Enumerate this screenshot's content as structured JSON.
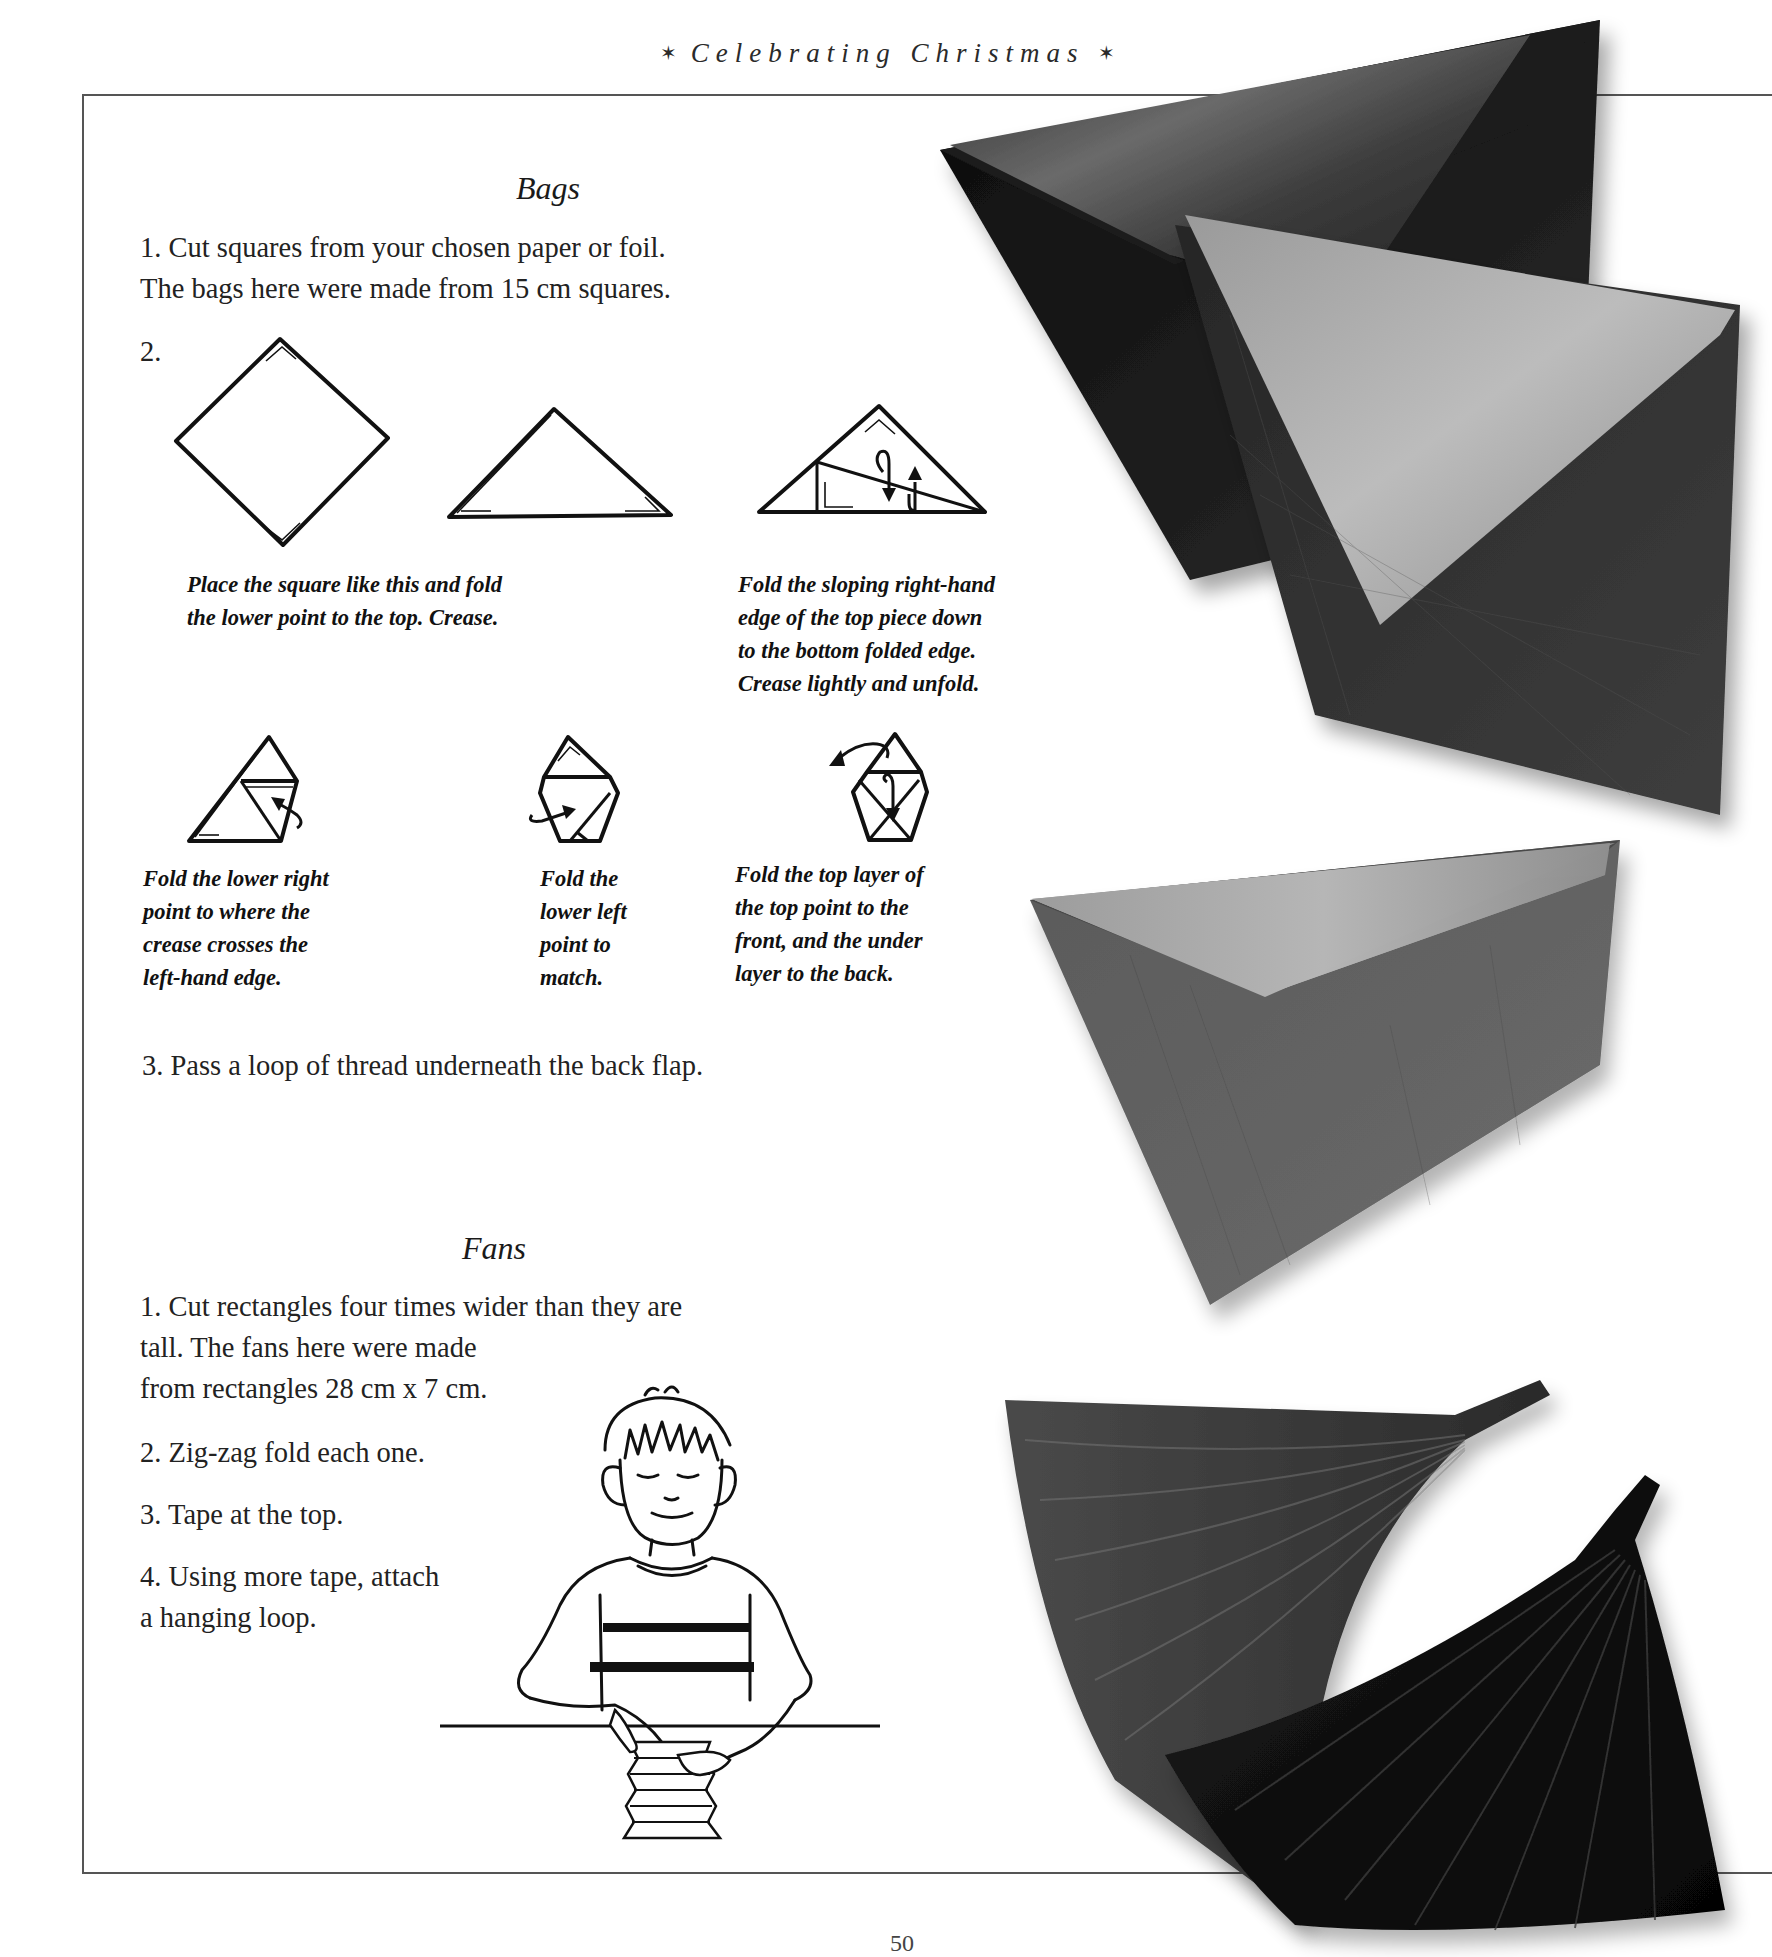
{
  "header": {
    "running_head": "Celebrating Christmas",
    "ornament_left": "✶",
    "ornament_right": "✶"
  },
  "bags": {
    "title": "Bags",
    "step1_line1": "1. Cut squares from your chosen paper or foil.",
    "step1_line2": "The bags here were made from 15 cm squares.",
    "step2_label": "2.",
    "captions": {
      "fold_to_top": [
        "Place the square like this and fold",
        "the lower point to the top. Crease."
      ],
      "sloping_edge": [
        "Fold the sloping right-hand",
        "edge of the top piece down",
        "to the bottom folded edge.",
        "Crease lightly and unfold."
      ],
      "lower_right": [
        "Fold the lower right",
        "point to where the",
        "crease crosses the",
        "left-hand edge."
      ],
      "lower_left": [
        "Fold the",
        "lower left",
        "point to",
        "match."
      ],
      "top_layer": [
        "Fold the top layer of",
        "the top point to the",
        "front, and the under",
        "layer to the back."
      ]
    },
    "step3": "3. Pass a loop of thread underneath the back flap."
  },
  "fans": {
    "title": "Fans",
    "step1_line1": "1. Cut rectangles four times wider than they are",
    "step1_line2": "tall. The fans here were made",
    "step1_line3": "from rectangles 28 cm x 7 cm.",
    "step2": "2. Zig-zag fold each one.",
    "step3": "3. Tape at the top.",
    "step4_line1": "4. Using more tape, attach",
    "step4_line2": "a hanging loop."
  },
  "footer": {
    "page_number": "50"
  }
}
